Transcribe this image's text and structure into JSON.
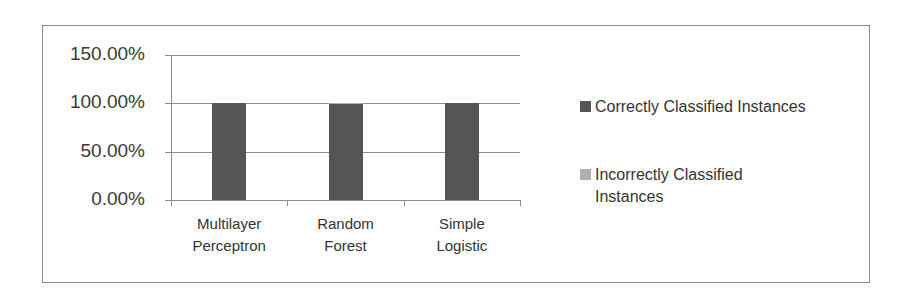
{
  "chart_data": {
    "type": "bar",
    "title": "",
    "xlabel": "",
    "ylabel": "",
    "categories": [
      "Multilayer Perceptron",
      "Random Forest",
      "Simple Logistic"
    ],
    "category_lines": [
      [
        "Multilayer",
        "Perceptron"
      ],
      [
        "Random",
        "Forest"
      ],
      [
        "Simple",
        "Logistic"
      ]
    ],
    "series": [
      {
        "name": "Correctly Classified Instances",
        "values": [
          100.0,
          99.5,
          100.0
        ],
        "color": "#555555"
      },
      {
        "name": "Incorrectly Classified Instances",
        "values": [
          0.0,
          0.5,
          0.0
        ],
        "color": "#b0b0b0"
      }
    ],
    "ylim": [
      0,
      150
    ],
    "yticks": [
      "0.00%",
      "50.00%",
      "100.00%",
      "150.00%"
    ],
    "grid": true,
    "legend_position": "right"
  },
  "legend": {
    "items": [
      {
        "label_lines": [
          "Correctly Classified Instances"
        ]
      },
      {
        "label_lines": [
          "Incorrectly Classified",
          "Instances"
        ]
      }
    ]
  }
}
